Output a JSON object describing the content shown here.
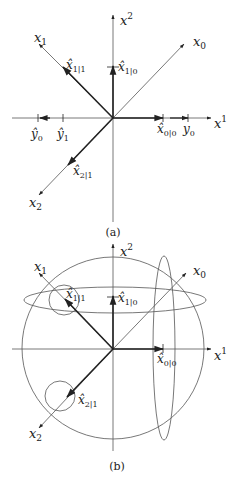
{
  "panel_a": {
    "caption": "(a)",
    "axes": {
      "horizontal": "x",
      "horizontal_sup": "1",
      "vertical": "x",
      "vertical_sup": "2"
    },
    "vectors": {
      "x0": {
        "base": "x",
        "sub": "0"
      },
      "x1": {
        "base": "x",
        "sub": "1"
      },
      "x2": {
        "base": "x",
        "sub": "2"
      },
      "x1_1": {
        "base": "x̂",
        "sub": "1|1"
      },
      "x1_0": {
        "base": "x̂",
        "sub": "1|0"
      },
      "x0_0": {
        "base": "x̂",
        "sub": "0|0"
      },
      "x2_1": {
        "base": "x̂",
        "sub": "2|1"
      }
    },
    "ticks": {
      "y0": {
        "base": "y",
        "sub": "0"
      },
      "y0_hat": {
        "base": "ŷ",
        "sub": "0"
      },
      "y1_hat": {
        "base": "ŷ",
        "sub": "1"
      }
    }
  },
  "panel_b": {
    "caption": "(b)",
    "axes": {
      "horizontal": "x",
      "horizontal_sup": "1",
      "vertical": "x",
      "vertical_sup": "2"
    },
    "vectors": {
      "x0": {
        "base": "x",
        "sub": "0"
      },
      "x1": {
        "base": "x",
        "sub": "1"
      },
      "x2": {
        "base": "x",
        "sub": "2"
      },
      "x1_1": {
        "base": "x̂",
        "sub": "1|1"
      },
      "x1_0": {
        "base": "x̂",
        "sub": "1|0"
      },
      "x0_0": {
        "base": "x̂",
        "sub": "0|0"
      },
      "x2_1": {
        "base": "x̂",
        "sub": "2|1"
      }
    },
    "shapes": [
      "large-circle",
      "horizontal-ellipse",
      "vertical-ellipse",
      "small-circle-x1|1",
      "small-circle-x2|1"
    ]
  },
  "colors": {
    "line": "#222222",
    "thin": "#555555",
    "background": "#ffffff"
  }
}
